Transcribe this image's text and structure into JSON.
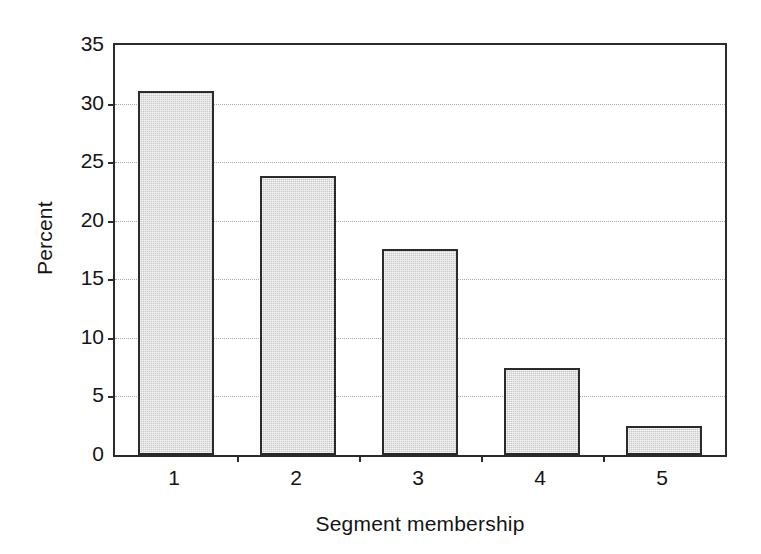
{
  "chart_data": {
    "type": "bar",
    "title": "",
    "xlabel": "Segment membership",
    "ylabel": "Percent",
    "categories": [
      "1",
      "2",
      "3",
      "4",
      "5"
    ],
    "values": [
      31.1,
      23.8,
      17.6,
      7.4,
      2.5
    ],
    "ylim": [
      0,
      35
    ],
    "ytick_labels": [
      "0",
      "5",
      "10",
      "15",
      "20",
      "25",
      "30",
      "35"
    ],
    "ytick_values": [
      0,
      5,
      10,
      15,
      20,
      25,
      30,
      35
    ],
    "grid": true,
    "grid_axis": "y",
    "grid_style": "dotted",
    "legend": "none",
    "bar_fill_color": "#c9c9c9",
    "bar_edge_color": "#2b2b2b",
    "axis_color": "#2b2b2b",
    "grid_color": "#aaaaaa",
    "background_color": "#ffffff"
  }
}
